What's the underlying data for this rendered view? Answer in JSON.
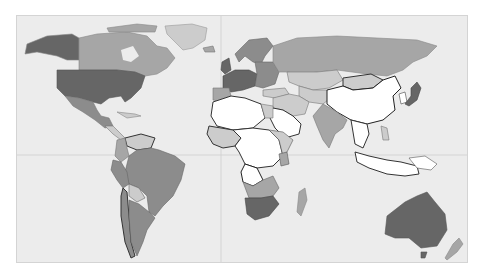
{
  "map": {
    "type": "choropleth-world",
    "projection": "equirectangular",
    "ocean_color": "#ececec",
    "frame_border_color": "#d4d4d4",
    "gridline_color": "#cfcfcf",
    "gridlines": {
      "meridian_x": 204,
      "equator_y": 139
    },
    "shade_levels": {
      "none": "#ffffff",
      "low": "#cccccc",
      "mid": "#a6a6a6",
      "high": "#8c8c8c",
      "top": "#666666"
    },
    "regions": [
      {
        "name": "Alaska",
        "level": "top",
        "stroke": "#888",
        "d": "M10,28 L30,20 L55,18 L62,22 L62,44 L50,44 L40,40 L30,38 L20,36 L8,38 Z"
      },
      {
        "name": "Canada",
        "level": "mid",
        "stroke": "#888",
        "d": "M62,22 L80,18 L110,16 L130,20 L140,30 L150,32 L158,42 L150,52 L140,58 L128,60 L118,56 L100,54 L62,54 Z"
      },
      {
        "name": "Hudson Bay",
        "level": "ocean",
        "stroke": "none",
        "d": "M104,34 L116,30 L122,40 L114,46 L106,44 Z"
      },
      {
        "name": "Greenland",
        "level": "low",
        "stroke": "#999",
        "d": "M148,10 L175,8 L190,12 L188,24 L176,32 L166,34 L158,26 L150,18 Z"
      },
      {
        "name": "Arctic Islands",
        "level": "mid",
        "stroke": "#888",
        "d": "M90,12 L120,8 L140,10 L138,16 L110,16 L92,16 Z"
      },
      {
        "name": "United States",
        "level": "top",
        "stroke": "#555",
        "d": "M40,54 L100,54 L118,56 L128,60 L124,72 L114,82 L108,86 L104,80 L92,82 L84,88 L76,86 L62,82 L48,80 L40,72 Z"
      },
      {
        "name": "Mexico",
        "level": "high",
        "stroke": "#777",
        "d": "M48,80 L62,82 L76,86 L80,94 L84,100 L92,102 L96,110 L88,112 L78,104 L66,96 L56,90 Z"
      },
      {
        "name": "Central America",
        "level": "low",
        "stroke": "#777",
        "d": "M88,110 L96,110 L102,116 L108,122 L104,124 L96,118 Z"
      },
      {
        "name": "Caribbean",
        "level": "low",
        "stroke": "#888",
        "d": "M100,96 L118,98 L124,100 L110,102 Z"
      },
      {
        "name": "Venezuela",
        "level": "low",
        "stroke": "#333",
        "d": "M108,122 L124,118 L138,122 L134,132 L120,134 L110,130 Z"
      },
      {
        "name": "Colombia",
        "level": "mid",
        "stroke": "#777",
        "d": "M100,124 L108,122 L110,132 L112,140 L104,146 L98,140 Z"
      },
      {
        "name": "Brazil",
        "level": "high",
        "stroke": "#666",
        "d": "M112,140 L120,134 L134,132 L142,134 L158,140 L168,148 L164,164 L156,180 L146,190 L138,200 L132,196 L130,180 L122,172 L112,168 L108,156 Z"
      },
      {
        "name": "Peru",
        "level": "high",
        "stroke": "#666",
        "d": "M96,144 L104,146 L110,156 L112,168 L106,172 L100,164 L94,154 Z"
      },
      {
        "name": "Bolivia",
        "level": "low",
        "stroke": "#666",
        "d": "M112,168 L122,172 L128,182 L120,186 L112,180 Z"
      },
      {
        "name": "Chile",
        "level": "high",
        "stroke": "#333",
        "d": "M106,172 L110,176 L112,200 L114,226 L118,240 L114,242 L108,226 L104,200 L104,180 Z"
      },
      {
        "name": "Argentina",
        "level": "high",
        "stroke": "#666",
        "d": "M112,184 L122,188 L132,196 L138,202 L130,214 L126,226 L120,240 L114,226 L112,200 Z"
      },
      {
        "name": "Iceland",
        "level": "mid",
        "stroke": "#777",
        "d": "M186,32 L196,30 L198,36 L188,36 Z"
      },
      {
        "name": "UK",
        "level": "top",
        "stroke": "#444",
        "d": "M205,46 L212,42 L214,54 L208,58 L204,54 Z"
      },
      {
        "name": "Scandinavia",
        "level": "high",
        "stroke": "#666",
        "d": "M218,38 L232,24 L250,22 L256,30 L248,40 L244,48 L236,46 L228,40 L222,46 Z"
      },
      {
        "name": "Western Europe",
        "level": "top",
        "stroke": "#444",
        "d": "M206,60 L218,54 L232,54 L240,58 L238,70 L226,74 L214,76 L206,72 Z"
      },
      {
        "name": "Iberia",
        "level": "mid",
        "stroke": "#777",
        "d": "M196,72 L212,72 L214,80 L206,86 L196,84 Z"
      },
      {
        "name": "Eastern Europe",
        "level": "high",
        "stroke": "#666",
        "d": "M238,46 L256,46 L262,56 L258,68 L246,72 L238,70 L240,58 Z"
      },
      {
        "name": "Russia",
        "level": "mid",
        "stroke": "#888",
        "d": "M256,30 L280,22 L320,20 L360,22 L400,24 L420,30 L410,40 L396,46 L386,54 L370,60 L350,58 L320,54 L300,56 L284,58 L270,56 L262,56 L256,46 Z"
      },
      {
        "name": "Kazakhstan",
        "level": "low",
        "stroke": "#777",
        "d": "M270,56 L300,56 L320,54 L326,64 L312,72 L296,74 L282,70 L272,66 Z"
      },
      {
        "name": "Turkey",
        "level": "low",
        "stroke": "#777",
        "d": "M246,74 L268,72 L272,78 L258,82 L246,80 Z"
      },
      {
        "name": "Central Asia",
        "level": "low",
        "stroke": "#777",
        "d": "M282,70 L296,74 L310,74 L316,80 L306,88 L292,86 L282,80 Z"
      },
      {
        "name": "Mongolia",
        "level": "low",
        "stroke": "#333",
        "d": "M326,62 L354,58 L366,64 L356,72 L336,74 L326,70 Z"
      },
      {
        "name": "China",
        "level": "none",
        "stroke": "#222",
        "d": "M310,74 L326,70 L336,74 L356,72 L366,64 L378,60 L384,72 L376,80 L378,94 L366,104 L350,108 L334,104 L320,96 L310,88 Z"
      },
      {
        "name": "Korea",
        "level": "none",
        "stroke": "#444",
        "d": "M382,78 L388,76 L390,86 L384,88 Z"
      },
      {
        "name": "Japan",
        "level": "top",
        "stroke": "#444",
        "d": "M394,72 L400,66 L404,72 L400,84 L392,90 L388,88 L394,80 Z"
      },
      {
        "name": "Middle East",
        "level": "low",
        "stroke": "#777",
        "d": "M256,82 L272,78 L282,80 L292,86 L288,98 L276,100 L266,94 L256,92 Z"
      },
      {
        "name": "Saudi Arabia",
        "level": "none",
        "stroke": "#333",
        "d": "M256,92 L266,94 L276,100 L284,108 L282,118 L268,122 L258,112 L252,100 Z"
      },
      {
        "name": "India",
        "level": "mid",
        "stroke": "#777",
        "d": "M306,88 L320,96 L330,104 L326,112 L318,118 L312,132 L306,124 L300,110 L296,100 Z"
      },
      {
        "name": "SE Asia",
        "level": "none",
        "stroke": "#333",
        "d": "M334,104 L350,108 L352,118 L346,132 L338,128 L336,116 Z"
      },
      {
        "name": "Philippines",
        "level": "low",
        "stroke": "#777",
        "d": "M364,110 L370,112 L372,124 L366,124 Z"
      },
      {
        "name": "Indonesia",
        "level": "none",
        "stroke": "#333",
        "d": "M338,136 L352,140 L370,144 L384,146 L400,150 L402,158 L388,160 L370,158 L352,152 L340,146 Z"
      },
      {
        "name": "Papua",
        "level": "none",
        "stroke": "#555",
        "d": "M392,142 L408,140 L420,148 L414,154 L400,152 Z"
      },
      {
        "name": "North Africa",
        "level": "none",
        "stroke": "#333",
        "d": "M196,86 L214,80 L228,82 L244,88 L248,102 L236,112 L216,114 L200,110 L194,100 Z"
      },
      {
        "name": "Egypt",
        "level": "low",
        "stroke": "#777",
        "d": "M244,88 L256,90 L256,102 L248,102 Z"
      },
      {
        "name": "West Africa",
        "level": "low",
        "stroke": "#333",
        "d": "M192,110 L216,114 L224,122 L218,130 L206,132 L196,128 L190,118 Z"
      },
      {
        "name": "Central Africa",
        "level": "none",
        "stroke": "#333",
        "d": "M216,114 L236,112 L252,114 L262,124 L266,140 L256,150 L240,152 L228,148 L222,136 L218,130 L224,122 Z"
      },
      {
        "name": "East Africa",
        "level": "low",
        "stroke": "#555",
        "d": "M252,114 L266,116 L276,124 L270,136 L266,140 L262,124 Z"
      },
      {
        "name": "Kenya",
        "level": "mid",
        "stroke": "#555",
        "d": "M262,138 L270,136 L272,148 L264,150 Z"
      },
      {
        "name": "Angola",
        "level": "none",
        "stroke": "#222",
        "d": "M228,148 L240,152 L246,164 L236,170 L226,166 L224,156 Z"
      },
      {
        "name": "Southern Africa",
        "level": "mid",
        "stroke": "#666",
        "d": "M226,166 L236,170 L246,164 L256,160 L262,172 L256,180 L244,182 L232,182 Z"
      },
      {
        "name": "South Africa",
        "level": "top",
        "stroke": "#444",
        "d": "M228,182 L244,182 L256,180 L262,188 L252,200 L238,204 L230,198 Z"
      },
      {
        "name": "Madagascar",
        "level": "mid",
        "stroke": "#888",
        "d": "M282,176 L288,172 L290,184 L284,200 L280,196 Z"
      },
      {
        "name": "Australia",
        "level": "top",
        "stroke": "#555",
        "d": "M370,200 L388,186 L400,180 L410,176 L418,186 L428,198 L430,214 L420,230 L404,232 L392,222 L378,222 L368,218 Z"
      },
      {
        "name": "Tasmania",
        "level": "top",
        "stroke": "#555",
        "d": "M404,236 L410,236 L408,242 L404,242 Z"
      },
      {
        "name": "New Zealand",
        "level": "mid",
        "stroke": "#888",
        "d": "M436,228 L442,222 L446,228 L440,236 L430,244 L428,242 Z"
      }
    ]
  }
}
